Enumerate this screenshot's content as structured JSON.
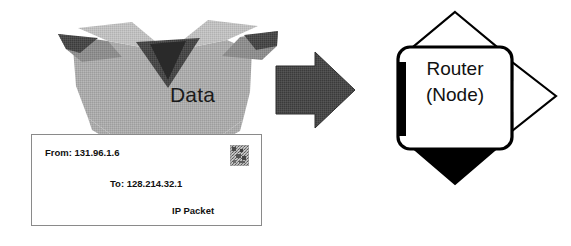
{
  "diagram": {
    "background_color": "#ffffff"
  },
  "data_box": {
    "icon_name": "open-carton-box",
    "label": "Data",
    "body_color": "#a8a8a8",
    "flap_color": "#bdbdbd",
    "inner_shadow_color": "#3c3c3c"
  },
  "envelope": {
    "name": "ip-packet-envelope",
    "from_line": "From:  131.96.1.6",
    "to_line": "To:  128.214.32.1",
    "type_line": "IP Packet",
    "border_color": "#8a8a8a",
    "fill_color": "#ffffff",
    "stamp_name": "postage-stamp"
  },
  "transfer_arrow": {
    "name": "transfer-arrow-right",
    "direction": "right",
    "fill_color": "#4a4a4a"
  },
  "router": {
    "name": "router-node",
    "label_line1": "Router",
    "label_line2": "(Node)",
    "outline_color": "#000000",
    "fill_color": "#ffffff",
    "arrows": [
      {
        "name": "router-arrow-up",
        "direction": "up",
        "style": "outline"
      },
      {
        "name": "router-arrow-right",
        "direction": "right",
        "style": "outline"
      },
      {
        "name": "router-arrow-down",
        "direction": "down",
        "style": "filled"
      }
    ]
  }
}
